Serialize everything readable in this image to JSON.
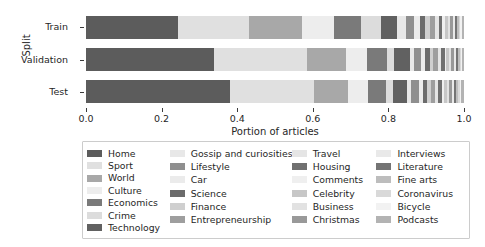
{
  "chart_data": {
    "type": "bar",
    "orientation": "horizontal",
    "stacked": true,
    "normalized": true,
    "title": "",
    "xlabel": "Portion of articles",
    "ylabel": "Split",
    "xlim": [
      0.0,
      1.0
    ],
    "xticks": [
      "0.0",
      "0.2",
      "0.4",
      "0.6",
      "0.8",
      "1.0"
    ],
    "xtick_values": [
      0.0,
      0.2,
      0.4,
      0.6,
      0.8,
      1.0
    ],
    "categories": [
      "Train",
      "Validation",
      "Test"
    ],
    "grid": false,
    "legend_position": "below-axes",
    "legend_columns": 4,
    "series": [
      {
        "name": "Home",
        "color": "#5c5c5c",
        "values": [
          0.244,
          0.336,
          0.377
        ]
      },
      {
        "name": "Sport",
        "color": "#e0e0e0",
        "values": [
          0.186,
          0.245,
          0.219
        ]
      },
      {
        "name": "World",
        "color": "#a8a8a8",
        "values": [
          0.142,
          0.103,
          0.09
        ]
      },
      {
        "name": "Culture",
        "color": "#ededed",
        "values": [
          0.085,
          0.056,
          0.053
        ]
      },
      {
        "name": "Economics",
        "color": "#7a7a7a",
        "values": [
          0.07,
          0.052,
          0.046
        ]
      },
      {
        "name": "Crime",
        "color": "#dcdcdc",
        "values": [
          0.054,
          0.019,
          0.019
        ]
      },
      {
        "name": "Technology",
        "color": "#616161",
        "values": [
          0.043,
          0.041,
          0.038
        ]
      },
      {
        "name": "Gossip and curiosities",
        "color": "#e8e8e8",
        "values": [
          0.022,
          0.011,
          0.01
        ]
      },
      {
        "name": "Lifestyle",
        "color": "#8f8f8f",
        "values": [
          0.021,
          0.019,
          0.019
        ]
      },
      {
        "name": "Car",
        "color": "#ebebeb",
        "values": [
          0.016,
          0.01,
          0.012
        ]
      },
      {
        "name": "Science",
        "color": "#6b6b6b",
        "values": [
          0.015,
          0.013,
          0.011
        ]
      },
      {
        "name": "Finance",
        "color": "#cfcfcf",
        "values": [
          0.013,
          0.009,
          0.01
        ]
      },
      {
        "name": "Entrepreneurship",
        "color": "#9e9e9e",
        "values": [
          0.012,
          0.013,
          0.011
        ]
      },
      {
        "name": "Travel",
        "color": "#e5e5e5",
        "values": [
          0.01,
          0.007,
          0.008
        ]
      },
      {
        "name": "Housing",
        "color": "#707070",
        "values": [
          0.009,
          0.01,
          0.01
        ]
      },
      {
        "name": "Comments",
        "color": "#efefef",
        "values": [
          0.008,
          0.005,
          0.006
        ]
      },
      {
        "name": "Celebrity",
        "color": "#c7c7c7",
        "values": [
          0.007,
          0.006,
          0.007
        ]
      },
      {
        "name": "Business",
        "color": "#e2e2e2",
        "values": [
          0.007,
          0.005,
          0.006
        ]
      },
      {
        "name": "Christmas",
        "color": "#999999",
        "values": [
          0.006,
          0.009,
          0.008
        ]
      },
      {
        "name": "Interviews",
        "color": "#e9e9e9",
        "values": [
          0.006,
          0.005,
          0.005
        ]
      },
      {
        "name": "Literature",
        "color": "#747474",
        "values": [
          0.005,
          0.006,
          0.005
        ]
      },
      {
        "name": "Fine arts",
        "color": "#bdbdbd",
        "values": [
          0.005,
          0.004,
          0.005
        ]
      },
      {
        "name": "Coronavirus",
        "color": "#d9d9d9",
        "values": [
          0.004,
          0.003,
          0.004
        ]
      },
      {
        "name": "Bicycle",
        "color": "#f2f2f2",
        "values": [
          0.004,
          0.003,
          0.004
        ]
      },
      {
        "name": "Podcasts",
        "color": "#b3b3b3",
        "values": [
          0.006,
          0.005,
          0.007
        ]
      }
    ]
  },
  "legend": {
    "columns": [
      [
        "Home",
        "Sport",
        "World",
        "Culture",
        "Economics",
        "Crime",
        "Technology"
      ],
      [
        "Gossip and curiosities",
        "Lifestyle",
        "Car",
        "Science",
        "Finance",
        "Entrepreneurship"
      ],
      [
        "Travel",
        "Housing",
        "Comments",
        "Celebrity",
        "Business",
        "Christmas"
      ],
      [
        "Interviews",
        "Literature",
        "Fine arts",
        "Coronavirus",
        "Bicycle",
        "Podcasts"
      ]
    ]
  }
}
